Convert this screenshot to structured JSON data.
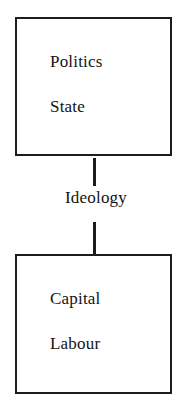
{
  "diagram": {
    "type": "flow-diagram",
    "orientation": "vertical",
    "background_color": "#ffffff",
    "line_color": "#1c1c1c",
    "text_color": "#141414",
    "nodes": [
      {
        "id": "politics-state",
        "labels": [
          "Politics",
          "State"
        ]
      },
      {
        "id": "capital-labour",
        "labels": [
          "Capital",
          "Labour"
        ]
      }
    ],
    "edges": [
      {
        "id": "ideology-edge",
        "from": "politics-state",
        "to": "capital-labour",
        "label": "Ideology",
        "arrowhead": "none",
        "style": "solid"
      }
    ]
  }
}
